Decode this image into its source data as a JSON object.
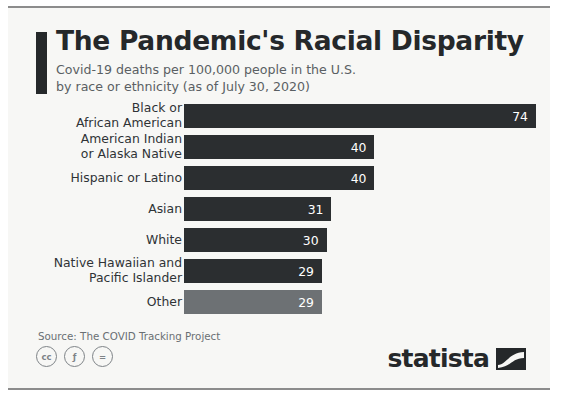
{
  "header": {
    "title": "The Pandemic's Racial Disparity",
    "subtitle_line1": "Covid-19 deaths per 100,000 people in the U.S.",
    "subtitle_line2": "by race or ethnicity (as of July 30, 2020)"
  },
  "footer": {
    "source": "Source: The COVID Tracking Project",
    "brand": "statista",
    "cc_badges": [
      {
        "name": "creative-commons-icon",
        "glyph": "cc"
      },
      {
        "name": "cc-attribution-icon",
        "glyph": "ƒ"
      },
      {
        "name": "cc-no-derivatives-icon",
        "glyph": "="
      }
    ]
  },
  "colors": {
    "bar_dark": "#2b2e30",
    "bar_light": "#6d7174",
    "title": "#25282a",
    "subtitle": "#5a5f63",
    "card_background": "#f7f7f5"
  },
  "chart_data": {
    "type": "bar",
    "orientation": "horizontal",
    "title": "The Pandemic's Racial Disparity",
    "subtitle": "Covid-19 deaths per 100,000 people in the U.S. by race or ethnicity (as of July 30, 2020)",
    "xlabel": "",
    "ylabel": "",
    "xlim": [
      0,
      74
    ],
    "grid": false,
    "legend": false,
    "source": "The COVID Tracking Project",
    "categories": [
      "Black or African American",
      "American Indian or Alaska Native",
      "Hispanic or Latino",
      "Asian",
      "White",
      "Native Hawaiian and Pacific Islander",
      "Other"
    ],
    "values": [
      74,
      40,
      40,
      31,
      30,
      29,
      29
    ],
    "bars": [
      {
        "label_line1": "Black or",
        "label_line2": "African American",
        "value": 74,
        "value_text": "74",
        "pct": 100.0,
        "style": "dark"
      },
      {
        "label_line1": "American Indian",
        "label_line2": "or Alaska Native",
        "value": 40,
        "value_text": "40",
        "pct": 54.1,
        "style": "dark"
      },
      {
        "label_line1": "Hispanic or Latino",
        "label_line2": "",
        "value": 40,
        "value_text": "40",
        "pct": 54.1,
        "style": "dark"
      },
      {
        "label_line1": "Asian",
        "label_line2": "",
        "value": 31,
        "value_text": "31",
        "pct": 41.9,
        "style": "dark"
      },
      {
        "label_line1": "White",
        "label_line2": "",
        "value": 30,
        "value_text": "30",
        "pct": 40.5,
        "style": "dark"
      },
      {
        "label_line1": "Native Hawaiian and",
        "label_line2": "Pacific Islander",
        "value": 29,
        "value_text": "29",
        "pct": 39.2,
        "style": "dark"
      },
      {
        "label_line1": "Other",
        "label_line2": "",
        "value": 29,
        "value_text": "29",
        "pct": 39.2,
        "style": "light"
      }
    ]
  }
}
